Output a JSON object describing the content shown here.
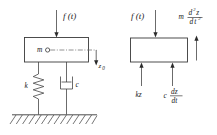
{
  "figure": {
    "background_color": "#ffffff",
    "line_color": "#2a2a2a",
    "dash_color": "#6d6d6d"
  },
  "left_diagram": {
    "name": "physical-system",
    "applied_force_label": "f (t)",
    "mass_label": "m",
    "displacement_label": "z",
    "displacement_subscript": "0",
    "spring_label": "k",
    "damper_label": "c",
    "ground": "hatched-fixed-support"
  },
  "right_diagram": {
    "name": "free-body-diagram",
    "applied_force_label": "f (t)",
    "inertia_label": "m",
    "inertia_numerator_d": "d",
    "inertia_numerator_sup": "2",
    "inertia_numerator_var": "z",
    "inertia_denominator_d": "d",
    "inertia_denominator_var": "t",
    "inertia_denominator_sup": "2",
    "spring_force_label": "kz",
    "damper_force_coeff": "c",
    "damper_force_numerator": "dz",
    "damper_force_denominator": "dt"
  }
}
